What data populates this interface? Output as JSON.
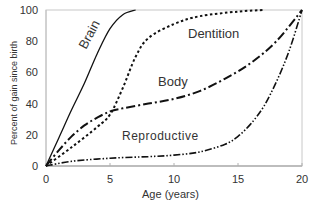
{
  "chart_data": {
    "type": "line",
    "title": "",
    "xlabel": "Age (years)",
    "ylabel": "Percent of gain since birth",
    "xlim": [
      0,
      20
    ],
    "ylim": [
      0,
      100
    ],
    "xticks": [
      0,
      5,
      10,
      15,
      20
    ],
    "yticks": [
      0,
      20,
      40,
      60,
      80,
      100
    ],
    "grid": false,
    "legend": "inline labels",
    "series": [
      {
        "name": "Brain",
        "style": "solid",
        "x": [
          0,
          1,
          2,
          3,
          4,
          5,
          6,
          7
        ],
        "y": [
          0,
          18,
          36,
          53,
          72,
          88,
          97,
          100
        ]
      },
      {
        "name": "Dentition",
        "style": "dotted",
        "x": [
          0,
          2,
          4,
          5,
          6,
          7,
          8,
          10,
          12,
          15,
          17
        ],
        "y": [
          0,
          12,
          25,
          33,
          50,
          70,
          82,
          91,
          96,
          99,
          100
        ]
      },
      {
        "name": "Body",
        "style": "dash-dot",
        "x": [
          0,
          1,
          2,
          3,
          4,
          5,
          6,
          8,
          10,
          12,
          14,
          16,
          18,
          20
        ],
        "y": [
          0,
          10,
          19,
          26,
          31,
          35,
          37,
          40,
          43,
          48,
          56,
          66,
          80,
          100
        ]
      },
      {
        "name": "Reproductive",
        "style": "dash-dot-dot",
        "x": [
          0,
          2,
          5,
          8,
          10,
          12,
          14,
          15,
          16,
          17,
          18,
          19,
          20
        ],
        "y": [
          0,
          3,
          5,
          6,
          7,
          9,
          14,
          19,
          27,
          38,
          54,
          74,
          100
        ]
      }
    ],
    "labels": {
      "brain": "Brain",
      "dentition": "Dentition",
      "body": "Body",
      "reproductive": "Reproductive"
    }
  }
}
